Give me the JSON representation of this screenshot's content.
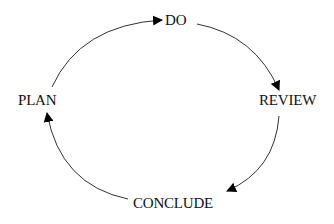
{
  "diagram": {
    "type": "cycle",
    "colors": {
      "line": "#333333",
      "arrow": "#000000",
      "text": "#111111",
      "background": "#ffffff"
    },
    "nodes": [
      {
        "id": "do",
        "label": "DO"
      },
      {
        "id": "review",
        "label": "REVIEW"
      },
      {
        "id": "conclude",
        "label": "CONCLUDE"
      },
      {
        "id": "plan",
        "label": "PLAN"
      }
    ],
    "edges": [
      {
        "from": "plan",
        "to": "do"
      },
      {
        "from": "do",
        "to": "review"
      },
      {
        "from": "review",
        "to": "conclude"
      },
      {
        "from": "conclude",
        "to": "plan"
      }
    ]
  }
}
